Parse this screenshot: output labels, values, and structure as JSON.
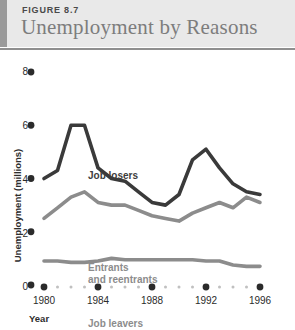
{
  "header": {
    "figure_number": "FIGURE 8.7",
    "title": "Unemployment by Reasons",
    "bar_color": "#9a9a9a",
    "band_color": "#e9e9e9",
    "title_color": "#7d7d7d"
  },
  "axes": {
    "ylabel": "Unemployment (millions)",
    "xlabel": "Year",
    "yticks": [
      "0",
      "2",
      "4",
      "6",
      "8"
    ],
    "xticks": [
      "1980",
      "1984",
      "1988",
      "1992",
      "1996"
    ]
  },
  "annotations": {
    "job_losers": "Job losers",
    "entrants_line1": "Entrants",
    "entrants_line2": "and reentrants",
    "job_leavers": "Job leavers"
  },
  "colors": {
    "job_losers": "#3a3a3a",
    "entrants": "#8c8c8c",
    "job_leavers": "#8c8c8c",
    "tick_dot": "#2b2b2b",
    "minor_dot": "#c0c0c0"
  },
  "chart_data": {
    "type": "line",
    "title": "Unemployment by Reasons",
    "xlabel": "Year",
    "ylabel": "Unemployment (millions)",
    "xlim": [
      1980,
      1996
    ],
    "ylim": [
      0,
      8
    ],
    "grid": false,
    "legend": "inline-annotations",
    "x": [
      1980,
      1981,
      1982,
      1983,
      1984,
      1985,
      1986,
      1987,
      1988,
      1989,
      1990,
      1991,
      1992,
      1993,
      1994,
      1995,
      1996
    ],
    "series": [
      {
        "name": "Job losers",
        "color": "#3a3a3a",
        "values": [
          4.0,
          4.3,
          6.0,
          6.0,
          4.4,
          4.0,
          3.9,
          3.5,
          3.1,
          3.0,
          3.4,
          4.7,
          5.1,
          4.4,
          3.8,
          3.5,
          3.4
        ]
      },
      {
        "name": "Entrants and reentrants",
        "color": "#8c8c8c",
        "values": [
          2.5,
          2.9,
          3.3,
          3.5,
          3.1,
          3.0,
          3.0,
          2.8,
          2.6,
          2.5,
          2.4,
          2.7,
          2.9,
          3.1,
          2.9,
          3.3,
          3.1
        ]
      },
      {
        "name": "Job leavers",
        "color": "#8c8c8c",
        "values": [
          0.9,
          0.9,
          0.85,
          0.85,
          0.9,
          1.0,
          0.95,
          0.95,
          0.95,
          0.95,
          0.95,
          0.95,
          0.9,
          0.9,
          0.75,
          0.7,
          0.7
        ]
      }
    ]
  }
}
